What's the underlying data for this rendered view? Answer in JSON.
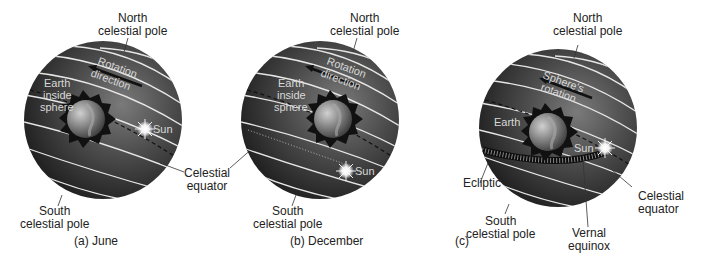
{
  "panels": [
    {
      "id": "a",
      "caption": "(a) June",
      "north_pole": [
        "North",
        "celestial pole"
      ],
      "south_pole": [
        "South",
        "celestial pole"
      ],
      "rotation_label": [
        "Rotation",
        "direction"
      ],
      "earth_label": [
        "Earth",
        "inside",
        "sphere"
      ],
      "sun_label": "Sun",
      "equator_label": [
        "Celestial",
        "equator"
      ]
    },
    {
      "id": "b",
      "caption": "(b) December",
      "north_pole": [
        "North",
        "celestial pole"
      ],
      "south_pole": [
        "South",
        "celestial pole"
      ],
      "rotation_label": [
        "Rotation",
        "direction"
      ],
      "earth_label": [
        "Earth",
        "inside",
        "sphere"
      ],
      "sun_label": "Sun"
    },
    {
      "id": "c",
      "caption": "(c)",
      "north_pole": [
        "North",
        "celestial pole"
      ],
      "south_pole": [
        "South",
        "celestial pole"
      ],
      "rotation_label": [
        "Sphere's",
        "rotation"
      ],
      "earth_label": [
        "Earth"
      ],
      "sun_label": "Sun",
      "ecliptic_label": "Ecliptic",
      "equinox_label": [
        "Vernal",
        "equinox"
      ],
      "equator_label": [
        "Celestial",
        "equator"
      ]
    }
  ],
  "colors": {
    "sphere_dark": "#1c1c1c",
    "sphere_light": "#6a6a6a",
    "circle_lines": "#e6e6e6",
    "label_text": "#222222",
    "inner_label_text": "#d8d8d8"
  }
}
